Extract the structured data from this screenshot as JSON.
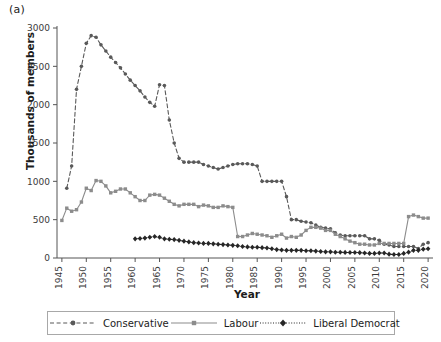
{
  "panel": {
    "label": "(a)"
  },
  "chart_data": {
    "type": "line",
    "title": "",
    "xlabel": "Year",
    "ylabel": "Thousands of members",
    "xlim": [
      1944,
      2021
    ],
    "ylim": [
      0,
      3000
    ],
    "xticks": [
      1945,
      1950,
      1955,
      1960,
      1965,
      1970,
      1975,
      1980,
      1985,
      1990,
      1995,
      2000,
      2005,
      2010,
      2015,
      2020
    ],
    "yticks": [
      0,
      500,
      1000,
      1500,
      2000,
      2500,
      3000
    ],
    "xtick_labels": [
      "1945",
      "1950",
      "1955",
      "1960",
      "1965",
      "1970",
      "1975",
      "1980",
      "1985",
      "1990",
      "1995",
      "2000",
      "2005",
      "2010",
      "2015",
      "2020"
    ],
    "ytick_labels": [
      "0",
      "500",
      "1000",
      "1500",
      "2000",
      "2500",
      "3000"
    ],
    "grid": false,
    "legend_position": "below",
    "series": [
      {
        "name": "Conservative",
        "color": "#595959",
        "linestyle": "dashed",
        "marker": "circle",
        "x": [
          1946,
          1947,
          1948,
          1949,
          1950,
          1951,
          1952,
          1953,
          1954,
          1955,
          1956,
          1957,
          1958,
          1959,
          1960,
          1961,
          1962,
          1963,
          1964,
          1965,
          1966,
          1967,
          1968,
          1969,
          1970,
          1971,
          1972,
          1973,
          1974,
          1975,
          1976,
          1977,
          1978,
          1979,
          1980,
          1981,
          1982,
          1983,
          1984,
          1985,
          1986,
          1987,
          1988,
          1989,
          1990,
          1991,
          1992,
          1993,
          1994,
          1995,
          1996,
          1997,
          1998,
          1999,
          2000,
          2001,
          2002,
          2003,
          2004,
          2005,
          2006,
          2007,
          2008,
          2009,
          2010,
          2011,
          2012,
          2013,
          2014,
          2015,
          2016,
          2017,
          2018,
          2019,
          2020
        ],
        "values": [
          910,
          1200,
          2200,
          2500,
          2800,
          2900,
          2880,
          2780,
          2700,
          2620,
          2550,
          2480,
          2400,
          2320,
          2250,
          2180,
          2100,
          2030,
          1980,
          2260,
          2250,
          1800,
          1500,
          1300,
          1250,
          1250,
          1250,
          1250,
          1220,
          1200,
          1180,
          1160,
          1180,
          1200,
          1220,
          1230,
          1230,
          1230,
          1220,
          1200,
          1000,
          1000,
          1000,
          1000,
          1000,
          800,
          500,
          500,
          480,
          470,
          460,
          430,
          400,
          390,
          380,
          330,
          300,
          290,
          290,
          290,
          290,
          290,
          250,
          250,
          230,
          180,
          170,
          150,
          150,
          150,
          150,
          150,
          124,
          180,
          200
        ]
      },
      {
        "name": "Labour",
        "color": "#8c8c8c",
        "linestyle": "solid",
        "marker": "square",
        "x": [
          1945,
          1946,
          1947,
          1948,
          1949,
          1950,
          1951,
          1952,
          1953,
          1954,
          1955,
          1956,
          1957,
          1958,
          1959,
          1960,
          1961,
          1962,
          1963,
          1964,
          1965,
          1966,
          1967,
          1968,
          1969,
          1970,
          1971,
          1972,
          1973,
          1974,
          1975,
          1976,
          1977,
          1978,
          1979,
          1980,
          1981,
          1982,
          1983,
          1984,
          1985,
          1986,
          1987,
          1988,
          1989,
          1990,
          1991,
          1992,
          1993,
          1994,
          1995,
          1996,
          1997,
          1998,
          1999,
          2000,
          2001,
          2002,
          2003,
          2004,
          2005,
          2006,
          2007,
          2008,
          2009,
          2010,
          2011,
          2012,
          2013,
          2014,
          2015,
          2016,
          2017,
          2018,
          2019,
          2020
        ],
        "values": [
          490,
          650,
          610,
          630,
          730,
          910,
          880,
          1010,
          1000,
          940,
          850,
          870,
          900,
          900,
          850,
          800,
          750,
          750,
          820,
          830,
          820,
          780,
          740,
          700,
          680,
          700,
          700,
          700,
          670,
          690,
          680,
          660,
          660,
          680,
          670,
          660,
          280,
          280,
          300,
          320,
          310,
          300,
          290,
          270,
          290,
          310,
          260,
          280,
          270,
          300,
          360,
          400,
          400,
          390,
          360,
          360,
          310,
          280,
          250,
          220,
          200,
          180,
          180,
          170,
          170,
          190,
          190,
          190,
          190,
          190,
          190,
          540,
          560,
          540,
          520,
          520
        ]
      },
      {
        "name": "Liberal Democrat",
        "color": "#262626",
        "linestyle": "dotted",
        "marker": "diamond",
        "x": [
          1960,
          1961,
          1962,
          1963,
          1964,
          1965,
          1966,
          1967,
          1968,
          1969,
          1970,
          1971,
          1972,
          1973,
          1974,
          1975,
          1976,
          1977,
          1978,
          1979,
          1980,
          1981,
          1982,
          1983,
          1984,
          1985,
          1986,
          1987,
          1988,
          1989,
          1990,
          1991,
          1992,
          1993,
          1994,
          1995,
          1996,
          1997,
          1998,
          1999,
          2000,
          2001,
          2002,
          2003,
          2004,
          2005,
          2006,
          2007,
          2008,
          2009,
          2010,
          2011,
          2012,
          2013,
          2014,
          2015,
          2016,
          2017,
          2018,
          2019,
          2020
        ],
        "values": [
          250,
          255,
          260,
          270,
          280,
          270,
          250,
          245,
          240,
          230,
          220,
          210,
          200,
          195,
          190,
          190,
          185,
          180,
          175,
          170,
          165,
          160,
          150,
          145,
          140,
          140,
          135,
          130,
          120,
          110,
          105,
          100,
          100,
          100,
          100,
          95,
          95,
          90,
          85,
          80,
          80,
          75,
          75,
          73,
          72,
          72,
          70,
          65,
          60,
          60,
          65,
          65,
          50,
          45,
          45,
          60,
          76,
          100,
          100,
          115,
          120
        ]
      }
    ]
  },
  "legend": {
    "items": [
      {
        "label": "Conservative"
      },
      {
        "label": "Labour"
      },
      {
        "label": "Liberal Democrat"
      }
    ]
  }
}
